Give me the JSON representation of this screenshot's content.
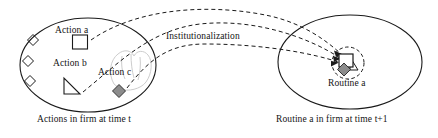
{
  "figure": {
    "type": "conceptual-diagram",
    "title_text": "",
    "left_group": {
      "caption": "Actions in firm at time t",
      "ellipse": {
        "cx": 88,
        "cy": 65,
        "rx": 68,
        "ry": 47
      },
      "labels": [
        {
          "key": "action_a",
          "text": "Action a"
        },
        {
          "key": "action_b",
          "text": "Action b"
        },
        {
          "key": "action_c",
          "text": "Action c"
        }
      ],
      "shapes": [
        {
          "name": "square-action-a",
          "glyph": "square",
          "fill": "none",
          "cx": 80,
          "cy": 42,
          "size": 14
        },
        {
          "name": "triangle-action-b",
          "glyph": "right-triangle",
          "fill": "none",
          "cx": 72,
          "cy": 86,
          "size": 16
        },
        {
          "name": "diamond-action-c",
          "glyph": "diamond",
          "fill": "#8c8c8c",
          "cx": 119,
          "cy": 91,
          "size": 12
        },
        {
          "name": "diamond-unlabeled-1",
          "glyph": "diamond",
          "fill": "none",
          "cx": 33,
          "cy": 40,
          "size": 11
        },
        {
          "name": "diamond-unlabeled-2",
          "glyph": "diamond",
          "fill": "none",
          "cx": 28,
          "cy": 61,
          "size": 11
        },
        {
          "name": "diamond-unlabeled-3",
          "glyph": "diamond",
          "fill": "none",
          "cx": 30,
          "cy": 81,
          "size": 11
        }
      ]
    },
    "right_group": {
      "caption": "Routine a in firm at time t+1",
      "ellipse": {
        "cx": 350,
        "cy": 62,
        "rx": 72,
        "ry": 47
      },
      "labels": [
        {
          "key": "routine_a",
          "text": "Routine a"
        }
      ],
      "cluster": {
        "name": "routine-a-cluster",
        "dashed_circle": {
          "cx": 348,
          "cy": 63,
          "r": 16
        },
        "shapes": [
          {
            "name": "square-in-routine",
            "glyph": "square",
            "fill": "none",
            "cx": 346,
            "cy": 60,
            "size": 13
          },
          {
            "name": "triangle-in-routine",
            "glyph": "right-triangle",
            "fill": "none",
            "cx": 355,
            "cy": 65,
            "size": 13
          },
          {
            "name": "diamond-in-routine",
            "glyph": "diamond",
            "fill": "#8c8c8c",
            "cx": 344,
            "cy": 69,
            "size": 11
          }
        ]
      }
    },
    "process_label": "Institutionalization",
    "arrows": {
      "style": "dashed",
      "count": 3,
      "from": "left_group shapes",
      "to": "routine-a-cluster"
    },
    "colors": {
      "stroke": "#1a1a1a",
      "fill_gray": "#8c8c8c",
      "sketch_gray": "#c9c9c9",
      "background": "#ffffff"
    }
  }
}
